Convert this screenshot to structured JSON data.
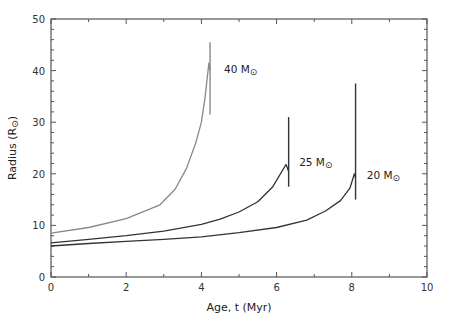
{
  "chart_data": {
    "type": "line",
    "title": "",
    "xlabel": "Age, t (Myr)",
    "ylabel": "Radius (R⊙)",
    "xlim": [
      0,
      10
    ],
    "ylim": [
      0,
      50
    ],
    "xticks": [
      0,
      2,
      4,
      6,
      8,
      10
    ],
    "yticks": [
      0,
      10,
      20,
      30,
      40,
      50
    ],
    "x_minor_step": 1,
    "y_minor_step": 2,
    "grid": false,
    "legend": "inline labels",
    "series": [
      {
        "name": "40 M⊙",
        "label_main": "40 M",
        "label_sub": "⊙",
        "color": "#888888",
        "label_pos": [
          4.6,
          39.5
        ],
        "points": [
          [
            0,
            8.5
          ],
          [
            1,
            9.6
          ],
          [
            2,
            11.3
          ],
          [
            2.9,
            14.0
          ],
          [
            3.3,
            17.0
          ],
          [
            3.6,
            21.0
          ],
          [
            3.85,
            26.0
          ],
          [
            4.0,
            30.0
          ],
          [
            4.1,
            35.0
          ],
          [
            4.2,
            41.5
          ],
          [
            4.23,
            40.0
          ]
        ],
        "end_line": {
          "t": 4.23,
          "r_top": 45.5,
          "r_bottom": 31.5
        }
      },
      {
        "name": "25 M⊙",
        "label_main": "25 M",
        "label_sub": "⊙",
        "color": "#333333",
        "label_pos": [
          6.6,
          21.5
        ],
        "points": [
          [
            0,
            6.6
          ],
          [
            1,
            7.3
          ],
          [
            2,
            8.0
          ],
          [
            3,
            8.9
          ],
          [
            4,
            10.2
          ],
          [
            4.5,
            11.2
          ],
          [
            5,
            12.6
          ],
          [
            5.5,
            14.6
          ],
          [
            5.9,
            17.5
          ],
          [
            6.25,
            21.8
          ],
          [
            6.32,
            20.5
          ]
        ],
        "end_line": {
          "t": 6.32,
          "r_top": 31.0,
          "r_bottom": 17.5
        }
      },
      {
        "name": "20 M⊙",
        "label_main": "20 M",
        "label_sub": "⊙",
        "color": "#333333",
        "label_pos": [
          8.4,
          19.0
        ],
        "points": [
          [
            0,
            6.0
          ],
          [
            1,
            6.5
          ],
          [
            2,
            6.9
          ],
          [
            3,
            7.3
          ],
          [
            4,
            7.8
          ],
          [
            5,
            8.6
          ],
          [
            6,
            9.6
          ],
          [
            6.8,
            11.0
          ],
          [
            7.3,
            12.8
          ],
          [
            7.7,
            14.8
          ],
          [
            7.95,
            17.2
          ],
          [
            8.07,
            20.0
          ],
          [
            8.1,
            19.2
          ]
        ],
        "end_line": {
          "t": 8.1,
          "r_top": 37.5,
          "r_bottom": 15.0
        }
      }
    ]
  }
}
